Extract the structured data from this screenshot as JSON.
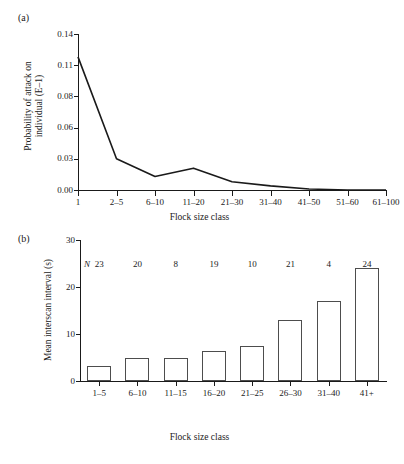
{
  "figure": {
    "panel_a_label": "(a)",
    "panel_b_label": "(b)"
  },
  "chart_data": [
    {
      "type": "line",
      "panel": "(a)",
      "title": "",
      "xlabel": "Flock size class",
      "ylabel": "Probability of attack on individual (E–1)",
      "ylabel_line1": "Probability of attack on",
      "ylabel_line2": "individual (E–1)",
      "categories": [
        "1",
        "2–5",
        "6–10",
        "11–20",
        "21–30",
        "31–40",
        "41–50",
        "51–60",
        "61–100"
      ],
      "values": [
        0.118,
        0.03,
        0.013,
        0.021,
        0.008,
        0.004,
        0.001,
        0.0,
        0.0
      ],
      "ytick_labels": [
        "0.00",
        "0.03",
        "0.06",
        "0.08",
        "0.11",
        "0.14"
      ],
      "ytick_values": [
        0.0,
        0.03,
        0.06,
        0.08,
        0.11,
        0.14
      ],
      "ylim": [
        0.0,
        0.14
      ],
      "grid": false,
      "legend": "none"
    },
    {
      "type": "bar",
      "panel": "(b)",
      "title": "",
      "xlabel": "Flock size class",
      "ylabel": "Mean interscan interval (s)",
      "categories": [
        "1–5",
        "6–10",
        "11–15",
        "16–20",
        "21–25",
        "26–30",
        "31–40",
        "41+"
      ],
      "values": [
        3.1,
        5.0,
        4.8,
        6.3,
        7.5,
        13.0,
        17.0,
        24.0
      ],
      "annotation_symbol": "N",
      "annotations": [
        "23",
        "20",
        "8",
        "19",
        "10",
        "21",
        "4",
        "24"
      ],
      "ytick_labels": [
        "0",
        "10",
        "20",
        "30"
      ],
      "ytick_values": [
        0,
        10,
        20,
        30
      ],
      "ylim": [
        0,
        30
      ],
      "grid": false,
      "legend": "none"
    }
  ],
  "colors": {
    "line": "#1a1a1a",
    "bar_edge": "#4d4d4d",
    "bar_fill": "#ffffff",
    "axis": "#1a1a1a",
    "text": "#1a1a1a",
    "background": "#ffffff"
  }
}
